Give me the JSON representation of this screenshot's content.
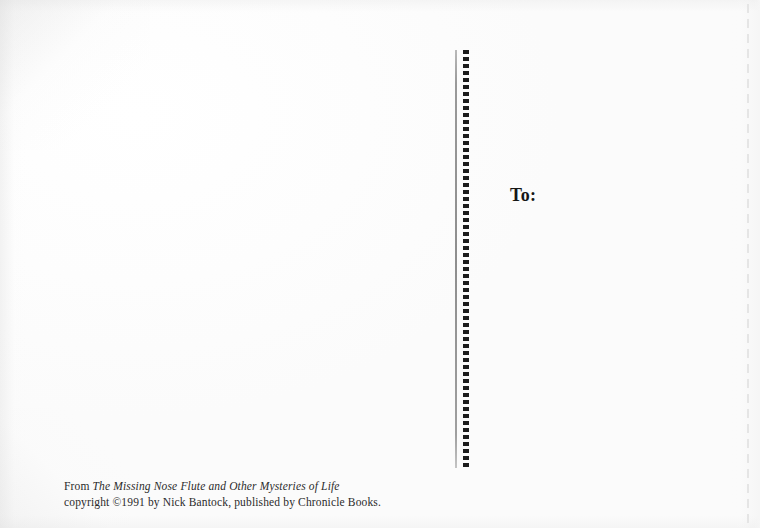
{
  "card": {
    "type": "postcard-back",
    "background_color": "#fdfdfd",
    "ink_color": "#1c1c1c"
  },
  "address_area": {
    "to_label": "To:"
  },
  "divider": {
    "style": "dotted-vertical-rule",
    "dot_color": "#1c1c1c",
    "rule_color": "#8e8e8e"
  },
  "credit": {
    "line1_prefix": "From ",
    "line1_title": "The Missing Nose Flute and Other Mysteries of Life",
    "line2": "copyright ©1991 by Nick Bantock, published by Chronicle Books."
  }
}
